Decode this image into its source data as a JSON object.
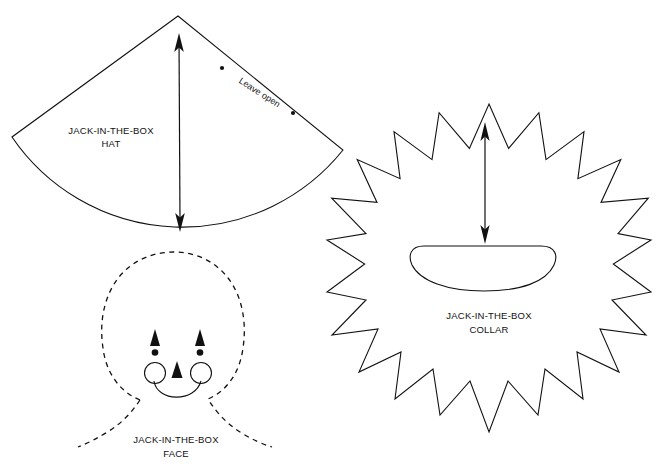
{
  "page": {
    "background_color": "#ffffff",
    "ink_color": "#111111",
    "width": 657,
    "height": 468
  },
  "pieces": [
    {
      "id": "hat",
      "name": "Jack-in-the-box hat",
      "label_line1": "JACK-IN-THE-BOX",
      "label_line2": "HAT",
      "shape": "sector",
      "outline_style": "solid",
      "annotation": "Leave open",
      "has_measure_arrow": true
    },
    {
      "id": "collar",
      "name": "Jack-in-the-box collar",
      "label_line1": "JACK-IN-THE-BOX",
      "label_line2": "COLLAR",
      "shape": "star-burst",
      "points": 20,
      "outline_style": "solid",
      "center_hole": "oval",
      "has_measure_arrow": true
    },
    {
      "id": "face",
      "name": "Jack-in-the-box face",
      "label_line1": "JACK-IN-THE-BOX",
      "label_line2": "FACE",
      "shape": "head-and-neck",
      "outline_style": "dashed",
      "features": [
        "left-eye",
        "right-eye",
        "nose",
        "smile",
        "left-cheek",
        "right-cheek"
      ],
      "has_measure_arrow": false
    }
  ],
  "hat": {
    "label_line1": "JACK-IN-THE-BOX",
    "label_line2": "HAT",
    "leave_open": "Leave open"
  },
  "collar": {
    "label_line1": "JACK-IN-THE-BOX",
    "label_line2": "COLLAR"
  },
  "face": {
    "label_line1": "JACK-IN-THE-BOX",
    "label_line2": "FACE"
  }
}
